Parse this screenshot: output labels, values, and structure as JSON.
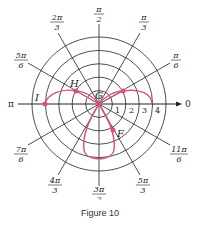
{
  "figure": {
    "caption": "Figure 10",
    "pole_label": "G",
    "axis_zero_label": "0",
    "axis_pi_label": "π",
    "radial_ticks": [
      "1",
      "2",
      "3",
      "4"
    ],
    "angle_labels": [
      {
        "num": "π",
        "den": "6"
      },
      {
        "num": "π",
        "den": "3"
      },
      {
        "num": "π",
        "den": "2"
      },
      {
        "num": "2π",
        "den": "3"
      },
      {
        "num": "5π",
        "den": "6"
      },
      {
        "num": "7π",
        "den": "6"
      },
      {
        "num": "4π",
        "den": "3"
      },
      {
        "num": "3π",
        "den": "2"
      },
      {
        "num": "5π",
        "den": "3"
      },
      {
        "num": "11π",
        "den": "6"
      }
    ],
    "points": [
      {
        "label": "F"
      },
      {
        "label": "G"
      },
      {
        "label": "H"
      },
      {
        "label": "I"
      }
    ],
    "colors": {
      "curve": "#d9507a",
      "grid": "#222222"
    }
  }
}
